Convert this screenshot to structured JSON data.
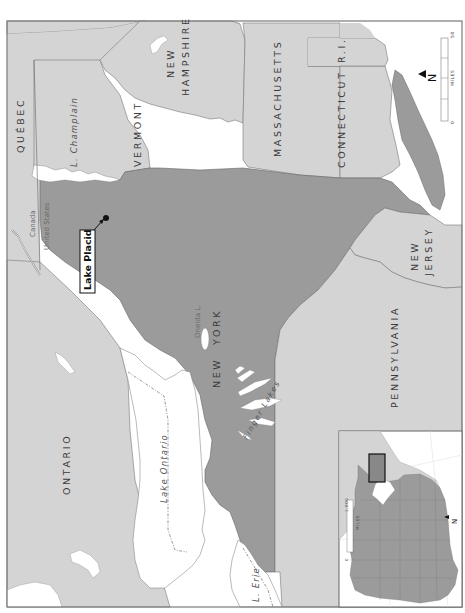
{
  "map": {
    "orientation": "rotated 90 degrees counter-clockwise",
    "colors": {
      "background": "#ffffff",
      "land_other": "#d4d4d4",
      "highlight_state": "#9b9b9b",
      "water": "#ffffff",
      "border": "#6f6f6f",
      "frame": "#7a7a7a",
      "text": "#3a3a3a"
    },
    "regions": {
      "quebec": "QUÉBEC",
      "ontario": "ONTARIO",
      "vermont": "VERMONT",
      "new_hampshire_1": "NEW",
      "new_hampshire_2": "HAMPSHIRE",
      "massachusetts": "MASSACHUSETTS",
      "connecticut": "CONNECTICUT",
      "rhode_island": "R.I.",
      "new_york_1": "NEW",
      "new_york_2": "YORK",
      "new_jersey_1": "NEW",
      "new_jersey_2": "JERSEY",
      "pennsylvania": "PENNSYLVANIA"
    },
    "water_features": {
      "lake_champlain": "L. Champlain",
      "lake_ontario": "Lake Ontario",
      "lake_erie": "L. Erie",
      "oneida_lake": "Oneida L.",
      "finger_lakes": "Finger Lakes"
    },
    "border_labels": {
      "canada": "Canada",
      "united_states": "United States"
    },
    "city": {
      "name": "Lake Placid"
    },
    "main_scale": {
      "start": "0",
      "end": "50",
      "unit": "MILES"
    },
    "north_arrow": {
      "label": "N"
    },
    "inset": {
      "scale_start": "0",
      "scale_end": "1,000",
      "scale_unit": "MILES",
      "north_label": "N"
    }
  }
}
